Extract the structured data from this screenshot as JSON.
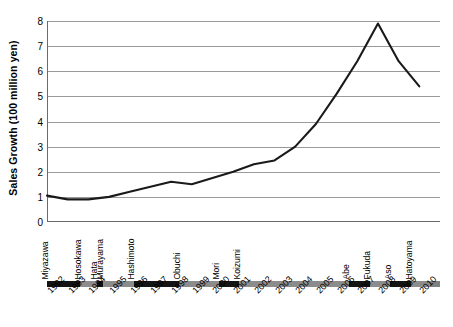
{
  "chart_data": {
    "type": "line",
    "title": "",
    "xlabel": "",
    "ylabel": "Sales Growth (100 million yen)",
    "ylim": [
      0,
      8
    ],
    "yticks": [
      0,
      1,
      2,
      3,
      4,
      5,
      6,
      7,
      8
    ],
    "grid": true,
    "legend": "none",
    "line_color": "#1a1a1a",
    "categories": [
      "1992",
      "1993",
      "1994",
      "1995",
      "1996",
      "1997",
      "1998",
      "1999",
      "2000",
      "2001",
      "2002",
      "2003",
      "2004",
      "2005",
      "2006",
      "2007",
      "2008",
      "2009",
      "2010"
    ],
    "values": [
      1.05,
      0.9,
      0.9,
      1.0,
      1.2,
      1.4,
      1.6,
      1.5,
      1.75,
      2.0,
      2.3,
      2.45,
      3.0,
      3.9,
      5.1,
      6.4,
      7.9,
      6.4,
      5.4
    ],
    "annotations": {
      "prime_ministers": [
        {
          "name": "Miyazawa",
          "start": 1992.0,
          "end": 1993.6,
          "shade": "dark"
        },
        {
          "name": "Hosokawa",
          "start": 1993.6,
          "end": 1994.4,
          "shade": "light"
        },
        {
          "name": "Hata",
          "start": 1994.4,
          "end": 1994.7,
          "shade": "dark"
        },
        {
          "name": "Murayama",
          "start": 1994.7,
          "end": 1996.2,
          "shade": "light"
        },
        {
          "name": "Hashimoto",
          "start": 1996.2,
          "end": 1998.4,
          "shade": "dark"
        },
        {
          "name": "Obuchi",
          "start": 1998.4,
          "end": 2000.3,
          "shade": "light"
        },
        {
          "name": "Mori",
          "start": 2000.3,
          "end": 2001.3,
          "shade": "dark"
        },
        {
          "name": "Koizumi",
          "start": 2001.3,
          "end": 2006.6,
          "shade": "light"
        },
        {
          "name": "Abe",
          "start": 2006.6,
          "end": 2007.6,
          "shade": "dark"
        },
        {
          "name": "Fukuda",
          "start": 2007.6,
          "end": 2008.6,
          "shade": "light"
        },
        {
          "name": "Aso",
          "start": 2008.6,
          "end": 2009.6,
          "shade": "dark"
        },
        {
          "name": "Hatoyama",
          "start": 2009.6,
          "end": 2010.5,
          "shade": "light"
        }
      ]
    },
    "colors": {
      "dark_segment": "#141414",
      "light_segment": "#8c8c8c",
      "gridline": "#9a9a9a",
      "axis": "#6b6b6b"
    }
  }
}
